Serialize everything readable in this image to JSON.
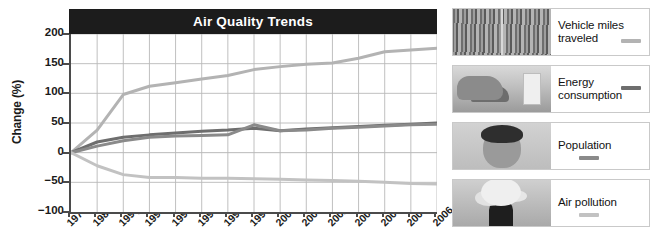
{
  "chart_data": {
    "type": "line",
    "title": "Air Quality Trends",
    "xlabel": "",
    "ylabel": "Change (%)",
    "ylim": [
      -100,
      200
    ],
    "yticks": [
      200,
      150,
      100,
      50,
      0,
      -50,
      -100
    ],
    "ytick_labels": [
      "200",
      "150",
      "100",
      "50",
      "0",
      "−50",
      "−100"
    ],
    "grid": true,
    "legend_position": "right",
    "axis_break": {
      "between": [
        "1990",
        "1995"
      ],
      "marker": "//"
    },
    "categories": [
      "1970",
      "1980",
      "1990",
      "1995",
      "1996",
      "1997",
      "1998",
      "1999",
      "2000",
      "2001",
      "2002",
      "2003",
      "2004",
      "2005",
      "2006"
    ],
    "series": [
      {
        "name": "Vehicle miles traveled",
        "color": "#b3b3b3",
        "values": [
          0,
          38,
          98,
          112,
          118,
          124,
          130,
          140,
          145,
          149,
          151,
          159,
          170,
          173,
          176
        ]
      },
      {
        "name": "Energy consumption",
        "color": "#6e6e6e",
        "values": [
          0,
          18,
          26,
          30,
          33,
          36,
          38,
          41,
          37,
          40,
          42,
          44,
          46,
          48,
          50
        ]
      },
      {
        "name": "Population",
        "color": "#8a8a8a",
        "values": [
          0,
          11,
          20,
          26,
          28,
          29,
          30,
          47,
          37,
          38,
          41,
          43,
          45,
          47,
          48
        ]
      },
      {
        "name": "Air pollution",
        "color": "#c2c2c2",
        "values": [
          0,
          -22,
          -37,
          -42,
          -42,
          -43,
          -43,
          -44,
          -45,
          -46,
          -47,
          -48,
          -50,
          -52,
          -53
        ]
      }
    ]
  },
  "chart": {
    "title": "Air Quality Trends",
    "y_axis_title": "Change (%)",
    "title_bar_color": "#1c1c1c",
    "title_text_color": "#ffffff",
    "grid_color": "#b9b9b9",
    "axis_color": "#4b4b4b"
  },
  "legend": {
    "items": [
      {
        "label_line1": "Vehicle miles",
        "label_line2": "traveled",
        "label": "Vehicle miles traveled",
        "swatch_color": "#b3b3b3",
        "swatch_position": "inline-bottom",
        "photo": "traffic-jam-photo"
      },
      {
        "label_line1": "Energy",
        "label_line2": "consumption",
        "label": "Energy consumption",
        "swatch_color": "#6e6e6e",
        "swatch_position": "inline-top",
        "photo": "hand-light-switch-photo"
      },
      {
        "label_line1": "Population",
        "label_line2": "",
        "label": "Population",
        "swatch_color": "#8a8a8a",
        "swatch_position": "below",
        "photo": "baby-face-photo"
      },
      {
        "label_line1": "Air pollution",
        "label_line2": "",
        "label": "Air pollution",
        "swatch_color": "#c2c2c2",
        "swatch_position": "below",
        "photo": "smokestack-photo"
      }
    ]
  }
}
